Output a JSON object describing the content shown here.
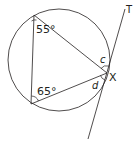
{
  "diagram": {
    "angles": {
      "top_vertex": "55°",
      "bottom_vertex": "65°",
      "c_label": "c",
      "d_label": "d"
    },
    "points": {
      "x_label": "X",
      "t_label": "T"
    },
    "colors": {
      "stroke": "#231f20",
      "background": "#ffffff"
    }
  }
}
